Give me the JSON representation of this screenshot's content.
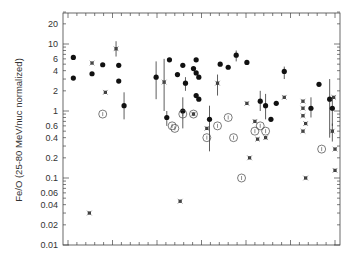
{
  "chart_data": {
    "type": "scatter",
    "title": "",
    "xlabel": "",
    "ylabel": "Fe/O (25-80 MeV/nuc normalized)",
    "yscale": "log",
    "ylim": [
      0.01,
      30
    ],
    "xlim": [
      0,
      1
    ],
    "y_ticks": [
      {
        "value": 20,
        "label": "20"
      },
      {
        "value": 10,
        "label": "10"
      },
      {
        "value": 6,
        "label": "6"
      },
      {
        "value": 4,
        "label": "4"
      },
      {
        "value": 2,
        "label": "2"
      },
      {
        "value": 1,
        "label": "1"
      },
      {
        "value": 0.6,
        "label": "0.6"
      },
      {
        "value": 0.4,
        "label": "0.4"
      },
      {
        "value": 0.2,
        "label": "0.2"
      },
      {
        "value": 0.1,
        "label": "0.1"
      },
      {
        "value": 0.06,
        "label": "0.06"
      },
      {
        "value": 0.04,
        "label": "0.04"
      },
      {
        "value": 0.02,
        "label": "0.02"
      },
      {
        "value": 0.01,
        "label": "0.01"
      }
    ],
    "x_tick_labels": [],
    "grid": false,
    "legend": null,
    "series": [
      {
        "name": "filled circles",
        "marker": "filled-circle",
        "points": [
          {
            "x": 0.02,
            "y": 6.3
          },
          {
            "x": 0.02,
            "y": 3.1
          },
          {
            "x": 0.09,
            "y": 3.6
          },
          {
            "x": 0.13,
            "y": 4.9
          },
          {
            "x": 0.19,
            "y": 4.8
          },
          {
            "x": 0.19,
            "y": 2.8
          },
          {
            "x": 0.21,
            "y": 1.2,
            "err": [
              0.75,
              1.9
            ]
          },
          {
            "x": 0.33,
            "y": 3.2,
            "err": [
              1.5,
              5.5
            ]
          },
          {
            "x": 0.37,
            "y": 0.8,
            "err": [
              0.6,
              1.0
            ]
          },
          {
            "x": 0.38,
            "y": 5.8
          },
          {
            "x": 0.41,
            "y": 3.5
          },
          {
            "x": 0.43,
            "y": 4.8
          },
          {
            "x": 0.43,
            "y": 1.0,
            "err": [
              0.55,
              1.6
            ]
          },
          {
            "x": 0.44,
            "y": 2.6,
            "err": [
              2.0,
              3.2
            ]
          },
          {
            "x": 0.47,
            "y": 4.3
          },
          {
            "x": 0.48,
            "y": 5.8
          },
          {
            "x": 0.48,
            "y": 3.7
          },
          {
            "x": 0.49,
            "y": 3.2
          },
          {
            "x": 0.48,
            "y": 1.7
          },
          {
            "x": 0.49,
            "y": 1.5
          },
          {
            "x": 0.53,
            "y": 0.75,
            "err": [
              0.25,
              1.2
            ]
          },
          {
            "x": 0.57,
            "y": 5.0
          },
          {
            "x": 0.6,
            "y": 4.5
          },
          {
            "x": 0.63,
            "y": 6.8,
            "err": [
              5.5,
              8.0
            ]
          },
          {
            "x": 0.67,
            "y": 5.3
          },
          {
            "x": 0.72,
            "y": 1.4,
            "err": [
              1.0,
              2.0
            ]
          },
          {
            "x": 0.74,
            "y": 1.2,
            "err": [
              0.75,
              1.8
            ]
          },
          {
            "x": 0.76,
            "y": 0.75
          },
          {
            "x": 0.78,
            "y": 1.3
          },
          {
            "x": 0.81,
            "y": 3.9,
            "err": [
              3.0,
              4.6
            ]
          },
          {
            "x": 0.91,
            "y": 1.1,
            "err": [
              0.8,
              1.6
            ]
          },
          {
            "x": 0.94,
            "y": 2.5
          },
          {
            "x": 0.98,
            "y": 1.5,
            "err": [
              0.4,
              3.0
            ]
          },
          {
            "x": 0.99,
            "y": 1.1,
            "err": [
              0.6,
              1.6
            ]
          }
        ]
      },
      {
        "name": "open circles",
        "marker": "open-circle",
        "points": [
          {
            "x": 0.13,
            "y": 0.9
          },
          {
            "x": 0.39,
            "y": 0.6
          },
          {
            "x": 0.4,
            "y": 0.55
          },
          {
            "x": 0.43,
            "y": 0.9
          },
          {
            "x": 0.47,
            "y": 0.9
          },
          {
            "x": 0.52,
            "y": 0.4
          },
          {
            "x": 0.56,
            "y": 0.6
          },
          {
            "x": 0.6,
            "y": 0.8
          },
          {
            "x": 0.62,
            "y": 0.4
          },
          {
            "x": 0.65,
            "y": 0.1
          },
          {
            "x": 0.7,
            "y": 0.5
          },
          {
            "x": 0.72,
            "y": 0.6
          },
          {
            "x": 0.74,
            "y": 0.5
          },
          {
            "x": 0.95,
            "y": 0.27
          }
        ]
      },
      {
        "name": "asterisks",
        "marker": "asterisk",
        "points": [
          {
            "x": 0.08,
            "y": 0.03
          },
          {
            "x": 0.09,
            "y": 5.2
          },
          {
            "x": 0.14,
            "y": 1.9
          },
          {
            "x": 0.18,
            "y": 8.5,
            "err": [
              6.5,
              11.0
            ]
          },
          {
            "x": 0.36,
            "y": 2.7,
            "err": [
              1.0,
              6.0
            ]
          },
          {
            "x": 0.42,
            "y": 0.045
          },
          {
            "x": 0.47,
            "y": 0.9
          },
          {
            "x": 0.52,
            "y": 0.55
          },
          {
            "x": 0.56,
            "y": 2.6,
            "err": [
              1.7,
              3.5
            ]
          },
          {
            "x": 0.67,
            "y": 1.3
          },
          {
            "x": 0.68,
            "y": 0.2
          },
          {
            "x": 0.7,
            "y": 0.7
          },
          {
            "x": 0.71,
            "y": 0.38
          },
          {
            "x": 0.74,
            "y": 0.4
          },
          {
            "x": 0.81,
            "y": 1.6
          },
          {
            "x": 0.88,
            "y": 1.4
          },
          {
            "x": 0.88,
            "y": 1.1
          },
          {
            "x": 0.88,
            "y": 0.85
          },
          {
            "x": 0.89,
            "y": 0.65
          },
          {
            "x": 0.88,
            "y": 0.5
          },
          {
            "x": 0.89,
            "y": 0.1
          },
          {
            "x": 0.99,
            "y": 0.5,
            "err": [
              0.35,
              0.65
            ]
          },
          {
            "x": 0.995,
            "y": 1.6
          },
          {
            "x": 1.0,
            "y": 0.27
          },
          {
            "x": 1.0,
            "y": 0.13
          }
        ]
      }
    ]
  },
  "colors": {
    "axis": "#444444",
    "marker": "#111111",
    "asterisk": "#333333",
    "label": "#333333",
    "background": "#ffffff"
  }
}
